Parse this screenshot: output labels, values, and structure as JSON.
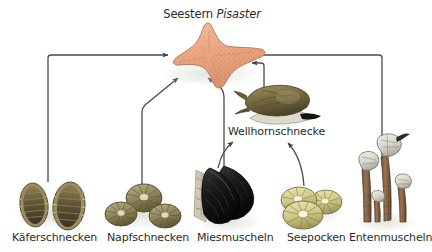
{
  "diagram": {
    "kind": "food-web",
    "title": {
      "genus_prefix": "Seestern ",
      "genus_italic": "Pisaster",
      "full": "Seestern Pisaster"
    },
    "background_color": "#ffffff",
    "line_color": "#4a4a4a",
    "text_color": "#2b2b2b",
    "nodes": [
      {
        "id": "seastern",
        "label": "Seestern Pisaster",
        "role": "predator-top",
        "icon": "starfish-icon",
        "color": "#e9a882"
      },
      {
        "id": "wellhornschnecke",
        "label": "Wellhornschnecke",
        "role": "predator-mid",
        "icon": "whelk-snail-icon",
        "color": "#7e7048"
      },
      {
        "id": "kaeferschnecken",
        "label": "Käferschnecken",
        "role": "prey",
        "icon": "chiton-icon",
        "color": "#6a5c39"
      },
      {
        "id": "napfschnecken",
        "label": "Napfschnecken",
        "role": "prey",
        "icon": "limpet-icon",
        "color": "#8d8257"
      },
      {
        "id": "miesmuscheln",
        "label": "Miesmuscheln",
        "role": "prey",
        "icon": "mussel-icon",
        "color": "#1b1b1b"
      },
      {
        "id": "seepocken",
        "label": "Seepocken",
        "role": "prey",
        "icon": "barnacle-icon",
        "color": "#cfc98a"
      },
      {
        "id": "entenmuscheln",
        "label": "Entenmuscheln",
        "role": "prey",
        "icon": "goose-barnacle-icon",
        "color": "#8a6a4e"
      }
    ],
    "edges": [
      {
        "from": "kaeferschnecken",
        "to": "seastern"
      },
      {
        "from": "napfschnecken",
        "to": "seastern"
      },
      {
        "from": "miesmuscheln",
        "to": "seastern"
      },
      {
        "from": "wellhornschnecke",
        "to": "seastern"
      },
      {
        "from": "entenmuscheln",
        "to": "seastern"
      },
      {
        "from": "miesmuscheln",
        "to": "wellhornschnecke"
      },
      {
        "from": "seepocken",
        "to": "wellhornschnecke"
      }
    ]
  }
}
